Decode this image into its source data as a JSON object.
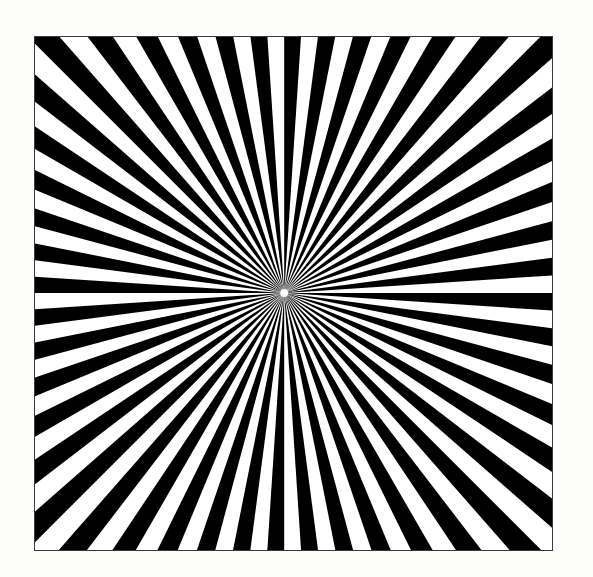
{
  "figure": {
    "caption": "",
    "background_color": "#fdfdfc",
    "panel_color": "#ffffff",
    "ray_color": "#000000",
    "gap_color": "#ffffff",
    "border_color": "#3a3a3a",
    "border_width_px": 1,
    "frame": {
      "x": 34,
      "y": 36,
      "width": 519,
      "height": 515
    }
  },
  "chart_data": {
    "type": "pie",
    "subtitle": "",
    "xlabel": "",
    "ylabel": "",
    "legend_position": "none",
    "grid": false,
    "center": {
      "x_fraction": 0.482,
      "y_fraction": 0.499,
      "x_px": 285,
      "y_px": 293
    },
    "ray_count": 48,
    "wedge_count_total": 96,
    "black_wedge_count": 48,
    "white_wedge_count": 48,
    "wedge_angle_degrees": 3.75,
    "period_angle_degrees": 7.5,
    "start_angle_degrees": 0,
    "inner_radius_px": 4,
    "outer_radius_px": 760,
    "duty_cycle": 0.5,
    "edge_black_stripe_counts": {
      "top": 13,
      "right": 11,
      "bottom": 13,
      "left": 11
    },
    "categories": [
      "wedge-01",
      "wedge-02",
      "wedge-03",
      "wedge-04",
      "wedge-05",
      "wedge-06",
      "wedge-07",
      "wedge-08",
      "wedge-09",
      "wedge-10",
      "wedge-11",
      "wedge-12",
      "wedge-13",
      "wedge-14",
      "wedge-15",
      "wedge-16",
      "wedge-17",
      "wedge-18",
      "wedge-19",
      "wedge-20",
      "wedge-21",
      "wedge-22",
      "wedge-23",
      "wedge-24",
      "wedge-25",
      "wedge-26",
      "wedge-27",
      "wedge-28",
      "wedge-29",
      "wedge-30",
      "wedge-31",
      "wedge-32",
      "wedge-33",
      "wedge-34",
      "wedge-35",
      "wedge-36",
      "wedge-37",
      "wedge-38",
      "wedge-39",
      "wedge-40",
      "wedge-41",
      "wedge-42",
      "wedge-43",
      "wedge-44",
      "wedge-45",
      "wedge-46",
      "wedge-47",
      "wedge-48"
    ],
    "values": [
      7.5,
      7.5,
      7.5,
      7.5,
      7.5,
      7.5,
      7.5,
      7.5,
      7.5,
      7.5,
      7.5,
      7.5,
      7.5,
      7.5,
      7.5,
      7.5,
      7.5,
      7.5,
      7.5,
      7.5,
      7.5,
      7.5,
      7.5,
      7.5,
      7.5,
      7.5,
      7.5,
      7.5,
      7.5,
      7.5,
      7.5,
      7.5,
      7.5,
      7.5,
      7.5,
      7.5,
      7.5,
      7.5,
      7.5,
      7.5,
      7.5,
      7.5,
      7.5,
      7.5,
      7.5,
      7.5,
      7.5,
      7.5
    ]
  }
}
